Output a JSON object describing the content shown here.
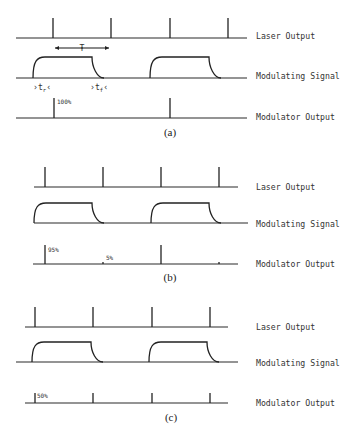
{
  "figure": {
    "row_labels": {
      "laser": "Laser Output",
      "signal": "Modulating Signal",
      "modulator": "Modulator Output"
    },
    "annotations": {
      "period": "T",
      "rise": "t",
      "rise_sub": "r",
      "fall": "t",
      "fall_sub": "f"
    },
    "panels": [
      {
        "caption": "(a)",
        "laser": {
          "y": 38,
          "x0": 16,
          "x1": 247,
          "pulses": [
            53,
            111,
            170,
            228
          ],
          "top": 18
        },
        "signal": {
          "y": 78,
          "x0": 16,
          "x1": 247,
          "pulses": [
            [
              33,
              92,
              104
            ],
            [
              150,
              209,
              221
            ]
          ],
          "top": 57
        },
        "modulator": {
          "y": 118,
          "x0": 16,
          "x1": 247,
          "pulses": [
            {
              "x": 54,
              "top": 98
            },
            {
              "x": 170,
              "top": 98
            }
          ],
          "labels": [
            {
              "text": "100%",
              "x": 57,
              "y": 104
            }
          ]
        },
        "label_y": [
          36,
          76,
          117
        ],
        "caption_pos": [
          170,
          136
        ],
        "show_T": true
      },
      {
        "caption": "(b)",
        "laser": {
          "y": 187,
          "x0": 34,
          "x1": 238,
          "pulses": [
            45,
            103,
            161,
            219
          ],
          "top": 167
        },
        "signal": {
          "y": 223,
          "x0": 34,
          "x1": 248,
          "pulses": [
            [
              34,
              92,
              104
            ],
            [
              151,
              209,
              221
            ]
          ],
          "top": 203
        },
        "modulator": {
          "y": 264,
          "x0": 33,
          "x1": 238,
          "pulses": [
            {
              "x": 45,
              "top": 245
            },
            {
              "x": 103,
              "top": 262
            },
            {
              "x": 161,
              "top": 245
            },
            {
              "x": 219,
              "top": 262
            }
          ],
          "labels": [
            {
              "text": "95%",
              "x": 48,
              "y": 252
            },
            {
              "text": "5%",
              "x": 106,
              "y": 260
            }
          ]
        },
        "label_y": [
          187,
          224,
          264
        ],
        "caption_pos": [
          170,
          281
        ],
        "show_T": false
      },
      {
        "caption": "(c)",
        "laser": {
          "y": 327,
          "x0": 25,
          "x1": 228,
          "pulses": [
            35,
            93,
            152,
            210
          ],
          "top": 307
        },
        "signal": {
          "y": 362,
          "x0": 16,
          "x1": 238,
          "pulses": [
            [
              32,
              91,
              103
            ],
            [
              149,
              207,
              219
            ]
          ],
          "top": 342
        },
        "modulator": {
          "y": 403,
          "x0": 25,
          "x1": 228,
          "pulses": [
            {
              "x": 35,
              "top": 393
            },
            {
              "x": 93,
              "top": 393
            },
            {
              "x": 152,
              "top": 393
            },
            {
              "x": 210,
              "top": 393
            }
          ],
          "labels": [
            {
              "text": "50%",
              "x": 37,
              "y": 398
            }
          ]
        },
        "label_y": [
          327,
          363,
          403
        ],
        "caption_pos": [
          171,
          421
        ],
        "show_T": false
      }
    ],
    "label_x": 256
  }
}
